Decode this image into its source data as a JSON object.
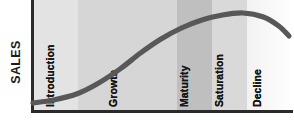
{
  "figure": {
    "y_axis_label": "SALES",
    "x_axis_label": ""
  },
  "colors": {
    "axis": "#2a2a2a",
    "curve": "#58585a",
    "band_introduction": "#e3e3e3",
    "band_growth": "#d6d6d6",
    "band_maturity": "#bfbfbf",
    "band_saturation": "#d9d9d9",
    "band_decline": "#f2f2f2",
    "label_text": "#171717"
  },
  "stages": [
    {
      "key": "introduction",
      "label": "Introduction",
      "x_start_pct": 0.0,
      "x_end_pct": 17.2,
      "fill": "#e3e3e3",
      "label_left_pct": 9.0
    },
    {
      "key": "growth",
      "label": "Growth",
      "x_start_pct": 17.2,
      "x_end_pct": 55.2,
      "fill": "#d6d6d6",
      "label_left_pct": 33.0
    },
    {
      "key": "maturity",
      "label": "Maturity",
      "x_start_pct": 55.2,
      "x_end_pct": 68.6,
      "fill": "#bfbfbf",
      "label_left_pct": 60.0
    },
    {
      "key": "saturation",
      "label": "Saturation",
      "x_start_pct": 68.6,
      "x_end_pct": 82.0,
      "fill": "#d9d9d9",
      "label_left_pct": 73.5
    },
    {
      "key": "decline",
      "label": "Decline",
      "x_start_pct": 82.0,
      "x_end_pct": 100.0,
      "fill": "#f2f2f2",
      "label_left_pct": 88.0
    }
  ],
  "chart_data": {
    "type": "line",
    "xlabel": "",
    "ylabel": "SALES",
    "xlim": [
      0,
      100
    ],
    "ylim": [
      0,
      100
    ],
    "grid": false,
    "legend": "none",
    "categories": [
      "Introduction",
      "Growth",
      "Maturity",
      "Saturation",
      "Decline"
    ],
    "category_boundaries_pct": [
      0,
      17.2,
      55.2,
      68.6,
      82.0,
      100.0
    ],
    "series": [
      {
        "name": "Sales",
        "x": [
          0,
          8,
          17,
          25,
          34,
          42,
          50,
          58,
          66,
          74,
          82,
          90,
          96,
          100
        ],
        "y": [
          5,
          8,
          14,
          24,
          39,
          55,
          69,
          80,
          88,
          93,
          95,
          91,
          82,
          72
        ]
      }
    ],
    "annotations": [
      {
        "text": "Introduction",
        "at_pct": 9.0,
        "orientation": "vertical"
      },
      {
        "text": "Growth",
        "at_pct": 33.0,
        "orientation": "vertical"
      },
      {
        "text": "Maturity",
        "at_pct": 60.0,
        "orientation": "vertical"
      },
      {
        "text": "Saturation",
        "at_pct": 73.5,
        "orientation": "vertical"
      },
      {
        "text": "Decline",
        "at_pct": 88.0,
        "orientation": "vertical"
      }
    ]
  }
}
